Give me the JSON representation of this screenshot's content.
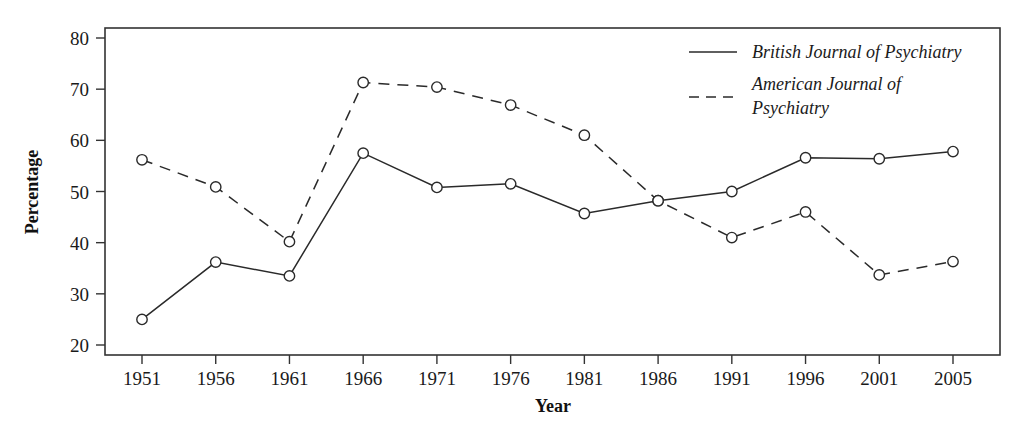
{
  "chart_data": {
    "type": "line",
    "title": "",
    "xlabel": "Year",
    "ylabel": "Percentage",
    "categories": [
      "1951",
      "1956",
      "1961",
      "1966",
      "1971",
      "1976",
      "1981",
      "1986",
      "1991",
      "1996",
      "2001",
      "2005"
    ],
    "x": [
      1951,
      1956,
      1961,
      1966,
      1971,
      1976,
      1981,
      1986,
      1991,
      1996,
      2001,
      2005
    ],
    "ylim": [
      16,
      84
    ],
    "yticks": [
      20,
      30,
      40,
      50,
      60,
      70,
      80
    ],
    "ytick_labels": [
      "20",
      "30",
      "40",
      "50",
      "60",
      "70",
      "80"
    ],
    "grid": false,
    "legend_position": "top-right",
    "series": [
      {
        "name": "British Journal of Psychiatry",
        "style": "solid",
        "marker": "open-circle",
        "color": "#2a2a2a",
        "values": [
          25.0,
          36.2,
          33.5,
          57.5,
          50.8,
          51.5,
          45.7,
          48.2,
          50.0,
          56.6,
          56.4,
          57.8
        ]
      },
      {
        "name": "American Journal of Psychiatry",
        "style": "dashed",
        "marker": "open-circle",
        "color": "#2a2a2a",
        "values": [
          56.2,
          50.9,
          40.2,
          71.3,
          70.4,
          66.9,
          61.0,
          48.2,
          41.0,
          46.0,
          33.7,
          36.3
        ]
      }
    ]
  },
  "legend": {
    "entries": [
      {
        "label": "British Journal of Psychiatry",
        "style": "solid"
      },
      {
        "label_line1": "American Journal of",
        "label_line2": "Psychiatry",
        "style": "dashed"
      }
    ]
  },
  "axes": {
    "y_title": "Percentage",
    "x_title": "Year"
  }
}
